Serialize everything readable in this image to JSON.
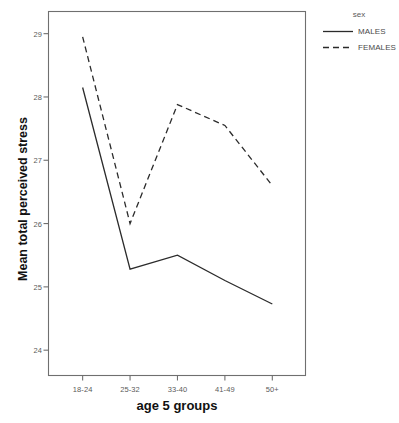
{
  "chart_data": {
    "type": "line",
    "title": "",
    "xlabel": "age 5 groups",
    "ylabel": "Mean total perceived stress",
    "categories": [
      "18-24",
      "25-32",
      "33-40",
      "41-49",
      "50+"
    ],
    "series": [
      {
        "name": "MALES",
        "style": "solid",
        "values": [
          28.15,
          25.28,
          25.5,
          25.1,
          24.73
        ]
      },
      {
        "name": "FEMALES",
        "style": "dashed",
        "values": [
          28.95,
          26.0,
          27.88,
          27.55,
          26.6
        ]
      }
    ],
    "ylim": [
      23.6,
      29.35
    ],
    "yticks": [
      24,
      25,
      26,
      27,
      28,
      29
    ],
    "ytick_labels": [
      "24",
      "25",
      "26",
      "27",
      "28",
      "29"
    ],
    "grid": false,
    "legend": {
      "title": "sex",
      "position": "right",
      "entries": [
        {
          "label": "MALES",
          "style": "solid"
        },
        {
          "label": "FEMALES",
          "style": "dashed"
        }
      ]
    },
    "colors": {
      "line": "#2b2b2b",
      "frame": "#6f6f6f",
      "text": "#4a4a4a",
      "title_text": "#111111",
      "background": "#ffffff"
    }
  }
}
